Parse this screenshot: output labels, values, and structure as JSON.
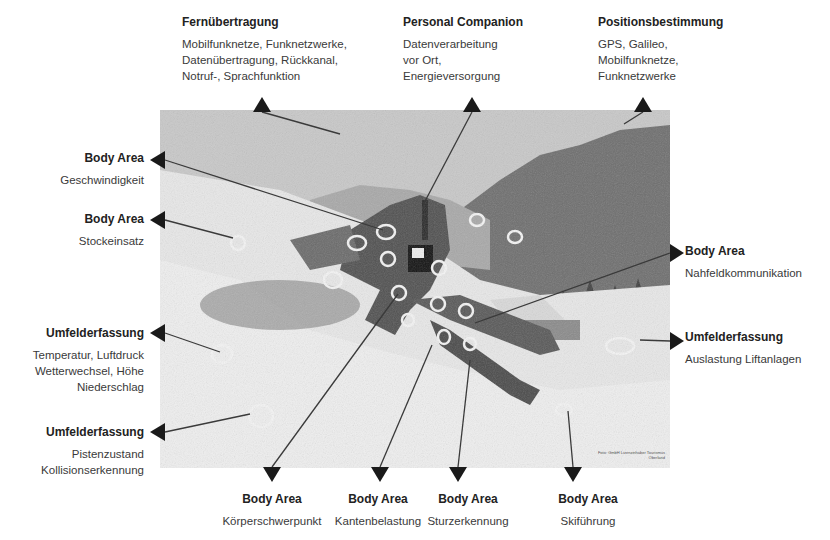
{
  "diagram": {
    "top_labels": [
      {
        "title": "Fernübertragung",
        "desc": "Mobilfunknetze, Funknetzwerke,\nDatenübertragung, Rückkanal,\nNotruf-, Sprachfunktion"
      },
      {
        "title": "Personal Companion",
        "desc": "Datenverarbeitung\nvor Ort,\nEnergieversorgung"
      },
      {
        "title": "Positionsbestimmung",
        "desc": "GPS, Galileo,\nMobilfunknetze,\nFunknetzwerke"
      }
    ],
    "left_labels": [
      {
        "title": "Body Area",
        "desc": "Geschwindigkeit"
      },
      {
        "title": "Body Area",
        "desc": "Stockeinsatz"
      },
      {
        "title": "Umfelderfassung",
        "desc": "Temperatur, Luftdruck\nWetterwechsel, Höhe\nNiederschlag"
      },
      {
        "title": "Umfelderfassung",
        "desc": "Pistenzustand\nKollisionserkennung"
      }
    ],
    "right_labels": [
      {
        "title": "Body Area",
        "desc": "Nahfeldkommunikation"
      },
      {
        "title": "Umfelderfassung",
        "desc": "Auslastung Liftanlagen"
      }
    ],
    "bottom_labels": [
      {
        "title": "Body Area",
        "desc": "Körperschwerpunkt"
      },
      {
        "title": "Body Area",
        "desc": "Kantenbelastung"
      },
      {
        "title": "Body Area",
        "desc": "Sturzerkennung"
      },
      {
        "title": "Body Area",
        "desc": "Skiführung"
      }
    ],
    "photo": {
      "subject": "Skier lying in snow with sensor markers, mountain background",
      "credit": "Foto: GmbH Lizenzinhaber\nTourismus Oberland"
    },
    "colors": {
      "arrow": "#1a1a1a",
      "line": "#3a3a3a",
      "sensor_ring": "#f0f0f0"
    }
  }
}
